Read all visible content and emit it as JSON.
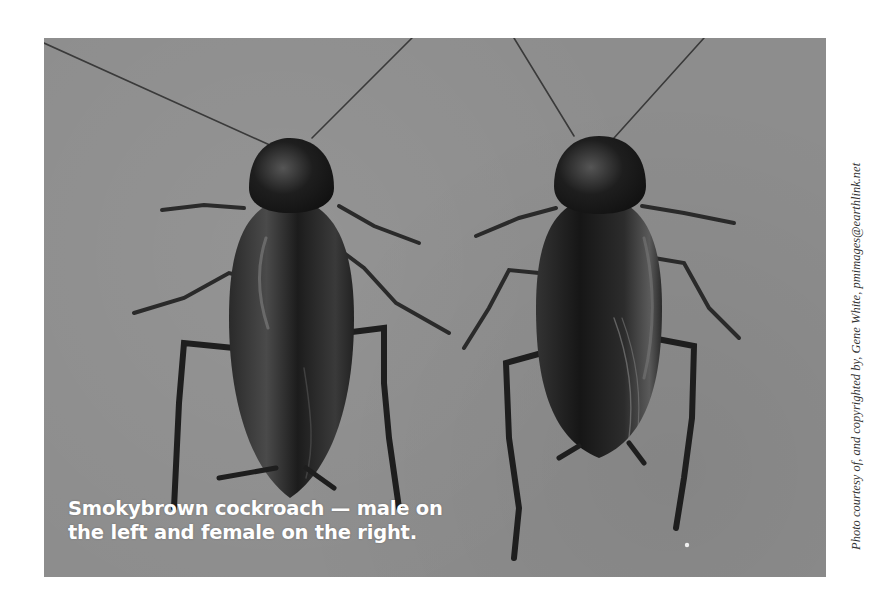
{
  "photo": {
    "description": "Two smokybrown cockroaches on a gray background",
    "background_color": "#8d8d8d",
    "subjects": [
      {
        "label": "male",
        "position": "left"
      },
      {
        "label": "female",
        "position": "right"
      }
    ]
  },
  "caption": {
    "line1": "Smokybrown cockroach — male on",
    "line2": "the left and female on the right."
  },
  "credit": {
    "text": "Photo courtesy of, and copyrighted by, Gene White, pmimages@earthlink.net"
  }
}
